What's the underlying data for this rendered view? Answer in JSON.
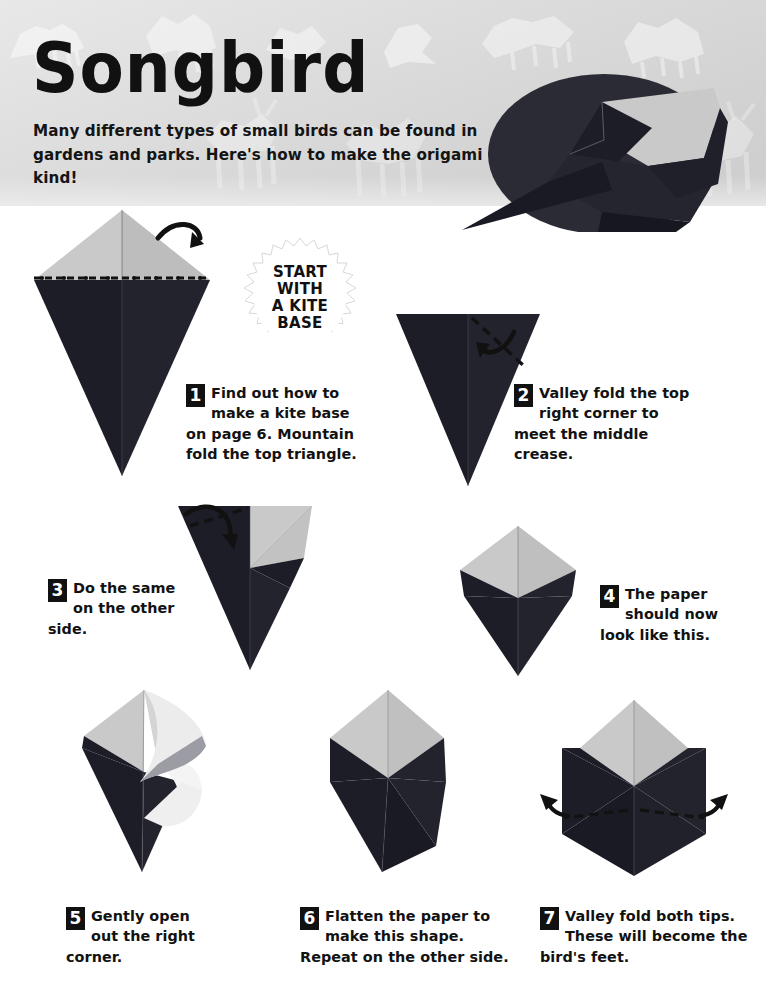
{
  "page": {
    "title": "Songbird",
    "intro": "Many different types of small birds can be found in gardens and parks. Here's how to make the origami kind!",
    "badge_lines": [
      "START",
      "WITH",
      "A KITE",
      "BASE"
    ],
    "colors": {
      "paper_dark": "#1d1d28",
      "paper_light": "#c9c9c9",
      "paper_white": "#f2f2f2",
      "photo_circle": "#2b2b35",
      "header_bg": "#dcdcdc",
      "ink": "#111111"
    }
  },
  "steps": [
    {
      "number": "1",
      "text": "Find out how to make a kite base on page 6. Mountain fold the top triangle.",
      "diagram": "kite-base-mountain-fold"
    },
    {
      "number": "2",
      "text": "Valley fold the top right corner to meet the middle crease.",
      "diagram": "inverted-triangle-valley-fold"
    },
    {
      "number": "3",
      "text": "Do the same on the other side.",
      "diagram": "one-corner-folded"
    },
    {
      "number": "4",
      "text": "The paper should now look like this.",
      "diagram": "both-corners-folded"
    },
    {
      "number": "5",
      "text": "Gently open out the right corner.",
      "diagram": "right-corner-opened"
    },
    {
      "number": "6",
      "text": "Flatten the paper to make this shape. Repeat on the other side.",
      "diagram": "flattened-both-sides"
    },
    {
      "number": "7",
      "text": "Valley fold both tips. These will become the bird's feet.",
      "diagram": "valley-fold-both-tips"
    }
  ]
}
